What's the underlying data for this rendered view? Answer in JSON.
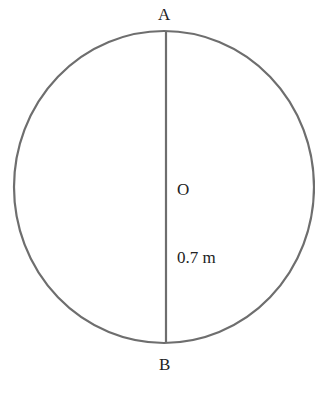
{
  "diagram": {
    "labels": {
      "top_point": "A",
      "bottom_point": "B",
      "center_point": "O",
      "radius_length": "0.7 m"
    },
    "colors": {
      "stroke": "#6e6e6e",
      "text": "#222222",
      "background": "#ffffff"
    }
  }
}
